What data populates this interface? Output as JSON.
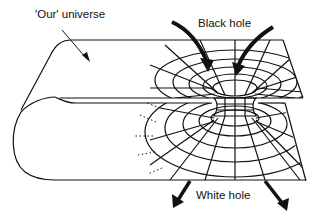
{
  "diagram": {
    "type": "wormhole-illustration",
    "labels": {
      "universe": "'Our' universe",
      "black_hole": "Black hole",
      "white_hole": "White hole"
    },
    "elements": [
      {
        "name": "upper-sheet",
        "description": "Upper portion of folded spacetime sheet with a funnel (black hole)"
      },
      {
        "name": "lower-sheet",
        "description": "Lower portion of folded spacetime sheet with an inverted funnel (white hole)"
      },
      {
        "name": "fold",
        "description": "Left-side fold connecting upper and lower sheets"
      },
      {
        "name": "throat",
        "description": "Wormhole throat connecting black hole and white hole"
      },
      {
        "name": "inflow-arrows",
        "description": "Two thick arrows pointing into the black hole"
      },
      {
        "name": "outflow-arrows",
        "description": "Two thick arrows pointing out of the white hole"
      },
      {
        "name": "universe-pointer",
        "description": "Thin arrow from label to upper sheet"
      }
    ],
    "colors": {
      "ink": "#111111",
      "background": "#ffffff"
    }
  }
}
